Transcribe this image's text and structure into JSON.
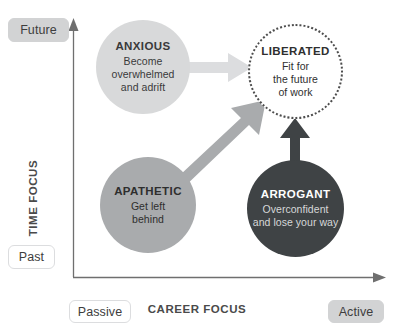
{
  "diagram": {
    "axes": {
      "y_title": "TIME FOCUS",
      "x_title": "CAREER FOCUS",
      "y_top_label": "Future",
      "y_bottom_label": "Past",
      "x_left_label": "Passive",
      "x_right_label": "Active"
    },
    "quadrants": [
      {
        "id": "anxious",
        "title": "ANXIOUS",
        "desc": "Become\noverwhelmed\nand adrift",
        "desc_lines": [
          "Become",
          "overwhelmed",
          "and adrift"
        ],
        "fill": "#d8d9da",
        "text_color": "#3a3a3a",
        "position": "top-left"
      },
      {
        "id": "liberated",
        "title": "LIBERATED",
        "desc": "Fit for\nthe future\nof work",
        "desc_lines": [
          "Fit for",
          "the future",
          "of work"
        ],
        "fill": "#ffffff",
        "border": "dotted #4d4d4d",
        "text_color": "#2f2f2f",
        "position": "top-right"
      },
      {
        "id": "apathetic",
        "title": "APATHETIC",
        "desc": "Get left\nbehind",
        "desc_lines": [
          "Get left",
          "behind"
        ],
        "fill": "#a9abad",
        "text_color": "#2e2e2e",
        "position": "bottom-left"
      },
      {
        "id": "arrogant",
        "title": "ARROGANT",
        "desc": "Overconfident\nand lose your way",
        "desc_lines": [
          "Overconfident",
          "and lose your way"
        ],
        "fill": "#3f4345",
        "text_color": "#ffffff",
        "position": "bottom-right"
      }
    ],
    "arrows": [
      {
        "id": "anxious-to-liberated",
        "from": "anxious",
        "to": "liberated",
        "color": "#dcdddf",
        "direction": "horizontal-right"
      },
      {
        "id": "apathetic-to-liberated",
        "from": "apathetic",
        "to": "liberated",
        "color": "#a9abad",
        "direction": "diagonal-up-right"
      },
      {
        "id": "arrogant-to-liberated",
        "from": "arrogant",
        "to": "liberated",
        "color": "#3f4345",
        "direction": "vertical-up"
      }
    ],
    "colors": {
      "axis_line": "#6f6f6f",
      "badge_filled": "#d2d3d4",
      "badge_outline_border": "#dcdddf",
      "background": "#ffffff"
    }
  }
}
